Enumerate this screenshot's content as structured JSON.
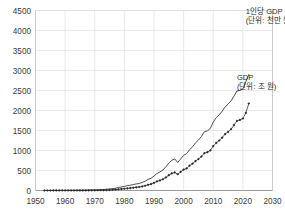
{
  "chart_data": {
    "type": "line",
    "title": "",
    "subtitle": "",
    "xlabel": "",
    "ylabel": "",
    "xlim": [
      1950,
      2030
    ],
    "ylim": [
      0,
      4500
    ],
    "grid": true,
    "legend_position": "inline-annotation",
    "x_ticks": [
      "1950",
      "1960",
      "1970",
      "1980",
      "1990",
      "2000",
      "2010",
      "2020",
      "2030"
    ],
    "y_ticks": [
      "0",
      "500",
      "1000",
      "1500",
      "2000",
      "2500",
      "3000",
      "3500",
      "4000",
      "4500"
    ],
    "annotations": [
      {
        "name": "per-capita-gdp-label",
        "line1": "1인당 GDP",
        "line2": "(단위: 천만 원)",
        "x": 2021,
        "y": 4420
      },
      {
        "name": "gdp-label",
        "line1": "GDP",
        "line2": "(단위: 조 원)",
        "x": 2018,
        "y": 2760
      }
    ],
    "series": [
      {
        "name": "1인당 GDP (단위: 천만 원)",
        "style": "line",
        "color": "#2f2f2f",
        "markers": false,
        "x": [
          1953,
          1954,
          1955,
          1956,
          1957,
          1958,
          1959,
          1960,
          1961,
          1962,
          1963,
          1964,
          1965,
          1966,
          1967,
          1968,
          1969,
          1970,
          1971,
          1972,
          1973,
          1974,
          1975,
          1976,
          1977,
          1978,
          1979,
          1980,
          1981,
          1982,
          1983,
          1984,
          1985,
          1986,
          1987,
          1988,
          1989,
          1990,
          1991,
          1992,
          1993,
          1994,
          1995,
          1996,
          1997,
          1998,
          1999,
          2000,
          2001,
          2002,
          2003,
          2004,
          2005,
          2006,
          2007,
          2008,
          2009,
          2010,
          2011,
          2012,
          2013,
          2014,
          2015,
          2016,
          2017,
          2018,
          2019,
          2020,
          2021,
          2022
        ],
        "values": [
          18,
          20,
          24,
          26,
          28,
          30,
          32,
          34,
          38,
          42,
          52,
          62,
          66,
          78,
          88,
          102,
          122,
          142,
          166,
          190,
          240,
          310,
          390,
          470,
          580,
          740,
          900,
          1010,
          1200,
          1320,
          1470,
          1640,
          1760,
          2010,
          2330,
          2760,
          3050,
          3600,
          4250,
          4650,
          5120,
          5920,
          6850,
          7550,
          7900,
          7000,
          7900,
          8800,
          9200,
          10200,
          10900,
          11900,
          12600,
          13500,
          14700,
          14900,
          15500,
          17100,
          18200,
          18900,
          19800,
          20900,
          21600,
          22400,
          23600,
          24900,
          25000,
          25400,
          27200,
          29000
        ],
        "values_note": "만원 단위 원계열 — 차트상 표시값은 천만 원 기준으로 1/10 축소",
        "plot_values": [
          1.8,
          2.0,
          2.4,
          2.6,
          2.8,
          3.0,
          3.2,
          3.4,
          3.8,
          4.2,
          5.2,
          6.2,
          6.6,
          7.8,
          8.8,
          10.2,
          12.2,
          14.2,
          16.6,
          19.0,
          24.0,
          31.0,
          39.0,
          47.0,
          58.0,
          74.0,
          90.0,
          101.0,
          120.0,
          132.0,
          147.0,
          164.0,
          176.0,
          201.0,
          233.0,
          276.0,
          305.0,
          360.0,
          425.0,
          465.0,
          512.0,
          592.0,
          685.0,
          755.0,
          790.0,
          700.0,
          790.0,
          880.0,
          920.0,
          1020.0,
          1090.0,
          1190.0,
          1260.0,
          1350.0,
          1470.0,
          1490.0,
          1550.0,
          1710.0,
          1820.0,
          1890.0,
          1980.0,
          2090.0,
          2160.0,
          2240.0,
          2360.0,
          2490.0,
          2500.0,
          2540.0,
          2720.0,
          2900.0
        ]
      },
      {
        "name": "GDP (단위: 조 원)",
        "style": "line-with-markers",
        "color": "#2b2b2b",
        "markers": true,
        "marker_shape": "diamond",
        "x": [
          1953,
          1954,
          1955,
          1956,
          1957,
          1958,
          1959,
          1960,
          1961,
          1962,
          1963,
          1964,
          1965,
          1966,
          1967,
          1968,
          1969,
          1970,
          1971,
          1972,
          1973,
          1974,
          1975,
          1976,
          1977,
          1978,
          1979,
          1980,
          1981,
          1982,
          1983,
          1984,
          1985,
          1986,
          1987,
          1988,
          1989,
          1990,
          1991,
          1992,
          1993,
          1994,
          1995,
          1996,
          1997,
          1998,
          1999,
          2000,
          2001,
          2002,
          2003,
          2004,
          2005,
          2006,
          2007,
          2008,
          2009,
          2010,
          2011,
          2012,
          2013,
          2014,
          2015,
          2016,
          2017,
          2018,
          2019,
          2020,
          2021,
          2022
        ],
        "values": [
          4,
          5,
          6,
          7,
          8,
          8,
          9,
          10,
          11,
          12,
          15,
          19,
          21,
          25,
          29,
          34,
          42,
          50,
          60,
          70,
          90,
          118,
          152,
          190,
          240,
          310,
          390,
          440,
          530,
          600,
          690,
          790,
          870,
          1010,
          1190,
          1430,
          1600,
          1910,
          2280,
          2530,
          2810,
          3270,
          3820,
          4260,
          4510,
          4060,
          4640,
          5220,
          5510,
          6200,
          6700,
          7360,
          7870,
          8490,
          9340,
          9570,
          10010,
          11100,
          11900,
          12500,
          13200,
          14100,
          14650,
          15320,
          16350,
          17400,
          17650,
          18000,
          19400,
          21750
        ],
        "values_note": "조 원 단위 — 차트상 수직축 값과 동일 스케일",
        "plot_values": [
          4,
          5,
          6,
          7,
          8,
          8,
          9,
          10,
          11,
          12,
          15,
          19,
          21,
          25,
          29,
          34,
          42,
          50,
          60,
          70,
          90,
          118,
          152,
          190,
          240,
          310,
          390,
          440,
          530,
          600,
          690,
          790,
          870,
          1010,
          1190,
          1430,
          1600,
          1910,
          2280,
          2530,
          2810,
          3270,
          3820,
          4260,
          4510,
          4060,
          4640,
          5220,
          5510,
          6200,
          6700,
          7360,
          7870,
          8490,
          9340,
          9570,
          10010,
          11100,
          11900,
          12500,
          13200,
          14100,
          14650,
          15320,
          16350,
          17400,
          17650,
          18000,
          19400,
          21750
        ],
        "plot_divisor": 10
      }
    ]
  },
  "colors": {
    "background": "#ffffff",
    "grid": "#d8dbe0",
    "axis": "#b9bcc2",
    "series_line": "#2f2f2f",
    "series_marker": "#2b2b2b",
    "tick_text": "#3a3a3a",
    "annotation_text": "#2b2b2b"
  }
}
